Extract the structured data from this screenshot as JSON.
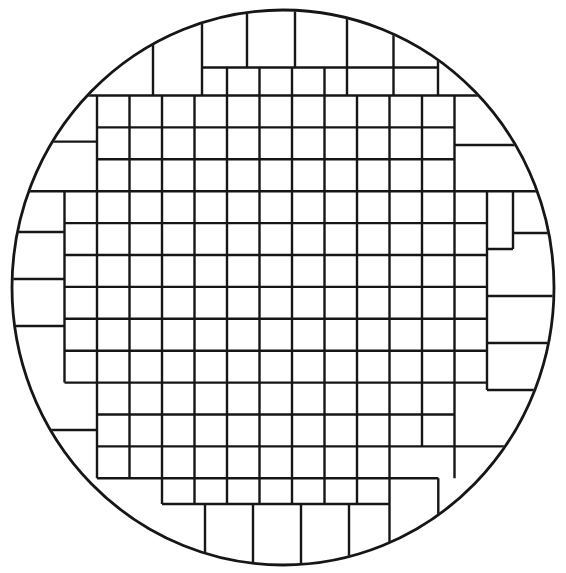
{
  "figure": {
    "type": "wafer-die-grid-diagram",
    "background_color": "#ffffff",
    "line_color": "#161616",
    "canvas": {
      "width": 566,
      "height": 573
    }
  },
  "wafer_outline": {
    "shape": "ellipse",
    "cx": 283,
    "cy": 287.5,
    "rx": 271,
    "ry": 277.5,
    "stroke_width": 2.8
  },
  "die_grid": {
    "stroke_width": 2.4,
    "inner_cell_size": {
      "width": 32.5,
      "height": 31.9
    },
    "column_lines_x": [
      64.5,
      97,
      129.5,
      162,
      194.5,
      227,
      259.5,
      292,
      324.5,
      357,
      389.5,
      422,
      454.5,
      487
    ],
    "row_lines_y": [
      95.5,
      127.4,
      159.3,
      191.2,
      223.1,
      255.0,
      286.9,
      318.8,
      350.7,
      382.6,
      414.5,
      446.4,
      478.3
    ],
    "v_segments": [
      [
        153,
        0,
        95.5
      ],
      [
        202,
        0,
        95.5
      ],
      [
        247,
        0,
        67.5
      ],
      [
        295,
        0,
        67.5
      ],
      [
        347,
        0,
        95.5
      ],
      [
        393.5,
        0,
        95.5
      ],
      [
        438,
        0,
        95.5
      ],
      [
        64.5,
        191.2,
        382.6
      ],
      [
        97,
        95.5,
        478.3
      ],
      [
        129.5,
        95.5,
        478.3
      ],
      [
        162,
        95.5,
        504
      ],
      [
        194.5,
        95.5,
        504
      ],
      [
        227,
        67.5,
        504
      ],
      [
        259.5,
        67.5,
        504
      ],
      [
        292,
        67.5,
        504
      ],
      [
        324.5,
        67.5,
        504
      ],
      [
        357,
        95.5,
        504
      ],
      [
        389.5,
        95.5,
        573
      ],
      [
        422,
        95.5,
        446.4
      ],
      [
        454.5,
        95.5,
        478.3
      ],
      [
        487,
        191.2,
        390
      ],
      [
        513,
        191.2,
        249
      ],
      [
        205,
        504,
        573
      ],
      [
        253,
        504,
        573
      ],
      [
        301,
        504,
        573
      ],
      [
        349,
        504,
        573
      ],
      [
        438.3,
        478.3,
        573
      ]
    ],
    "h_segments": [
      [
        67.5,
        202,
        438
      ],
      [
        95.5,
        0,
        566
      ],
      [
        127.4,
        97,
        454.5
      ],
      [
        159.3,
        97,
        454.5
      ],
      [
        191.2,
        0,
        566
      ],
      [
        223.1,
        64.5,
        487
      ],
      [
        255.0,
        64.5,
        487
      ],
      [
        286.9,
        64.5,
        487
      ],
      [
        318.8,
        64.5,
        487
      ],
      [
        350.7,
        64.5,
        487
      ],
      [
        382.6,
        64.5,
        487
      ],
      [
        414.5,
        97,
        454.5
      ],
      [
        446.4,
        97,
        566
      ],
      [
        478.3,
        97,
        438.3
      ],
      [
        504,
        162,
        389.5
      ],
      [
        141.6,
        0,
        97
      ],
      [
        232,
        0,
        64.5
      ],
      [
        279,
        0,
        64.5
      ],
      [
        326,
        0,
        64.5
      ],
      [
        430,
        0,
        97
      ],
      [
        145,
        454.5,
        566
      ],
      [
        233,
        513,
        566
      ],
      [
        249,
        487,
        513
      ],
      [
        296,
        487,
        566
      ],
      [
        343,
        487,
        566
      ],
      [
        390,
        487,
        566
      ]
    ]
  }
}
